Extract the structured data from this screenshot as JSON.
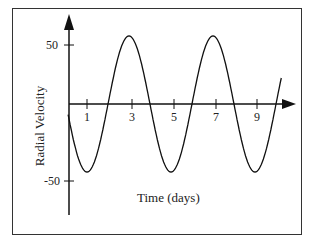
{
  "chart_data": {
    "type": "line",
    "title": "",
    "xlabel": "Time (days)",
    "ylabel": "Radial Velocity",
    "x_ticks": [
      "1",
      "3",
      "5",
      "7",
      "9"
    ],
    "y_ticks": [
      "50",
      "-50"
    ],
    "series": [
      {
        "name": "Radial Velocity",
        "description": "sinusoid, period ~4 days, amplitude ~50",
        "x": [
          0,
          1,
          2,
          3,
          4,
          5,
          6,
          7,
          8,
          9,
          10
        ],
        "values": [
          0,
          -50,
          0,
          50,
          0,
          -50,
          0,
          50,
          0,
          -50,
          0
        ]
      }
    ],
    "ylim": [
      -60,
      60
    ],
    "xlim": [
      0,
      10
    ],
    "grid": false,
    "legend": null
  },
  "labels": {
    "y50": "50",
    "yneg50": "-50",
    "t1": "1",
    "t3": "3",
    "t5": "5",
    "t7": "7",
    "t9": "9",
    "xlabel": "Time (days)",
    "ylabel": "Radial Velocity"
  }
}
